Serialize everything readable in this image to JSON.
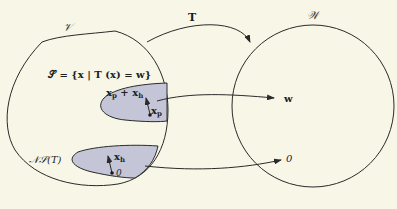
{
  "diagram": {
    "domain_label": "𝒱",
    "codomain_label": "𝒲",
    "map_label": "T",
    "solution_set_label": "𝒮 = {x | T (x) = w}",
    "particular_plus_homogeneous": "x",
    "particular_sub": "p",
    "homogeneous_sub": "h",
    "plus": "+",
    "xp_label": "x",
    "xh_label": "x",
    "zero_in_V": "0",
    "null_space_label": "𝒩𝒮(T)",
    "w_label": "w",
    "zero_in_W": "0",
    "colors": {
      "background": "#f8f6e6",
      "stroke": "#2a2a2a",
      "region_fill": "#c4c6d8"
    }
  }
}
